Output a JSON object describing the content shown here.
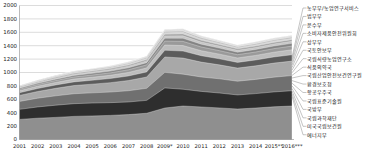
{
  "chart_data": {
    "type": "area",
    "title": "",
    "subtitle": "",
    "xlabel": "",
    "ylabel": "",
    "stacked": true,
    "grid": true,
    "legend_position": "right",
    "ylim": [
      0,
      2000
    ],
    "yticks": [
      0,
      200,
      400,
      600,
      800,
      1000,
      1200,
      1400,
      1600,
      1800,
      2000
    ],
    "categories": [
      "2001",
      "2002",
      "2003",
      "2004",
      "2005",
      "2006",
      "2007",
      "2008",
      "2009*",
      "2010",
      "2011",
      "2012",
      "2013",
      "2014",
      "2015**",
      "2016***"
    ],
    "series": [
      {
        "name": "에너지부",
        "color": "#8f8f8f",
        "values": [
          300,
          318,
          330,
          345,
          352,
          360,
          372,
          392,
          470,
          500,
          486,
          472,
          455,
          470,
          488,
          500
        ]
      },
      {
        "name": "미국국립보건원",
        "color": "#2e2e2e",
        "values": [
          150,
          168,
          182,
          190,
          192,
          190,
          188,
          192,
          300,
          250,
          232,
          222,
          210,
          215,
          222,
          228
        ]
      },
      {
        "name": "국립과학재단",
        "color": "#707070",
        "values": [
          118,
          130,
          140,
          148,
          152,
          158,
          168,
          180,
          232,
          225,
          215,
          212,
          205,
          212,
          220,
          226
        ]
      },
      {
        "name": "국방부",
        "color": "#a8a8a8",
        "values": [
          90,
          100,
          112,
          122,
          130,
          140,
          152,
          168,
          230,
          240,
          222,
          208,
          196,
          202,
          210,
          216
        ]
      },
      {
        "name": "국립표준기술원",
        "color": "#5c5c5c",
        "values": [
          40,
          45,
          50,
          55,
          58,
          62,
          68,
          76,
          100,
          105,
          96,
          90,
          85,
          88,
          92,
          95
        ]
      },
      {
        "name": "항공우주국",
        "color": "#bdbdbd",
        "values": [
          30,
          34,
          38,
          42,
          45,
          48,
          53,
          60,
          78,
          82,
          74,
          70,
          66,
          68,
          71,
          74
        ]
      },
      {
        "name": "환경보호청",
        "color": "#9a9a9a",
        "values": [
          22,
          25,
          28,
          31,
          33,
          36,
          40,
          45,
          58,
          62,
          56,
          52,
          49,
          51,
          53,
          55
        ]
      },
      {
        "name": "국립산업안전보건연구원",
        "color": "#848484",
        "values": [
          16,
          18,
          20,
          23,
          25,
          27,
          30,
          34,
          44,
          47,
          42,
          39,
          37,
          38,
          40,
          41
        ]
      },
      {
        "name": "식품의약국",
        "color": "#c6c6c6",
        "values": [
          12,
          14,
          16,
          18,
          19,
          21,
          23,
          26,
          34,
          36,
          32,
          30,
          28,
          29,
          30,
          31
        ]
      },
      {
        "name": "국립식량농업연구소",
        "color": "#9e9e9e",
        "values": [
          10,
          11,
          12,
          14,
          15,
          16,
          18,
          20,
          26,
          28,
          25,
          23,
          22,
          22,
          23,
          24
        ]
      },
      {
        "name": "국토안보부",
        "color": "#d2d2d2",
        "values": [
          0,
          6,
          9,
          11,
          12,
          13,
          15,
          17,
          22,
          24,
          21,
          20,
          18,
          19,
          20,
          20
        ]
      },
      {
        "name": "상무부",
        "color": "#b0b0b0",
        "values": [
          6,
          7,
          8,
          9,
          10,
          11,
          12,
          13,
          17,
          18,
          16,
          15,
          14,
          15,
          15,
          16
        ]
      },
      {
        "name": "소비자제품안전위원회",
        "color": "#dadada",
        "values": [
          4,
          4,
          5,
          6,
          6,
          7,
          8,
          9,
          12,
          13,
          11,
          10,
          10,
          10,
          11,
          11
        ]
      },
      {
        "name": "운수부",
        "color": "#c0c0c0",
        "values": [
          3,
          3,
          4,
          4,
          5,
          5,
          6,
          7,
          9,
          10,
          8,
          8,
          7,
          8,
          8,
          8
        ]
      },
      {
        "name": "법무부",
        "color": "#e2e2e2",
        "values": [
          2,
          2,
          3,
          3,
          3,
          4,
          4,
          5,
          7,
          7,
          6,
          6,
          5,
          6,
          6,
          6
        ]
      },
      {
        "name": "농무부/농업연구서비스",
        "color": "#cfcfcf",
        "values": [
          2,
          2,
          2,
          3,
          3,
          3,
          4,
          4,
          6,
          6,
          5,
          5,
          5,
          5,
          5,
          5
        ]
      }
    ]
  },
  "legend": {
    "items": [
      {
        "label": "농무부/농업연구서비스"
      },
      {
        "label": "법무부"
      },
      {
        "label": "운수부"
      },
      {
        "label": "소비자제품안전위원회"
      },
      {
        "label": "상무부"
      },
      {
        "label": "국토안보부"
      },
      {
        "label": "국립식량농업연구소"
      },
      {
        "label": "식품의약국"
      },
      {
        "label": "국립산업안전보건연구원"
      },
      {
        "label": "환경보호청"
      },
      {
        "label": "항공우주국"
      },
      {
        "label": "국립표준기술원"
      },
      {
        "label": "국방부"
      },
      {
        "label": "국립과학재단"
      },
      {
        "label": "미국국립보건원"
      },
      {
        "label": "에너지부"
      }
    ]
  }
}
